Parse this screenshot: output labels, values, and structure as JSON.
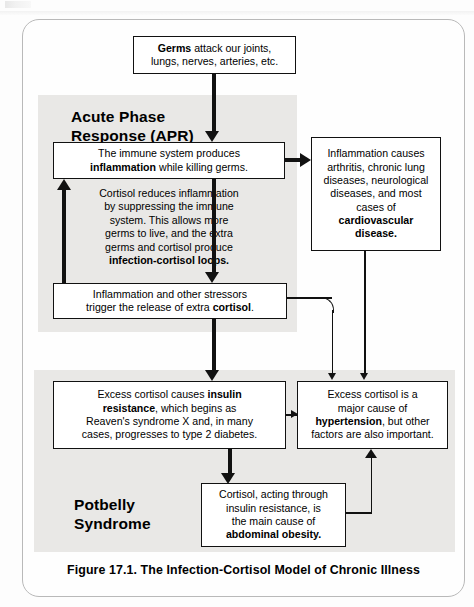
{
  "figure": {
    "caption": "Figure 17.1.  The Infection-Cortisol Model of Chronic Illness",
    "panels": {
      "apr_title": "Acute Phase\nResponse (APR)",
      "potbelly_title": "Potbelly\nSyndrome"
    },
    "nodes": {
      "germs": {
        "text_parts": [
          "Germs",
          " attack our joints, lungs, nerves, arteries, etc."
        ],
        "plain": "Germs attack our joints, lungs, nerves, arteries, etc."
      },
      "immune": {
        "plain": "The immune system produces inflammation while killing germs."
      },
      "inflammation_diseases": {
        "plain": "Inflammation causes arthritis, chronic lung diseases, neurological diseases, and most cases of cardiovascular disease."
      },
      "cortisol_reduces": {
        "plain": "Cortisol reduces inflammation by suppressing the immune system. This allows more germs to live, and the extra germs and cortisol produce infection-cortisol loops."
      },
      "trigger_cortisol": {
        "plain": "Inflammation and other stressors trigger the release of extra cortisol."
      },
      "insulin_resistance": {
        "plain": "Excess cortisol causes insulin resistance, which begins as Reaven's syndrome X and, in many cases, progresses to type 2 diabetes."
      },
      "hypertension": {
        "plain": "Excess cortisol is a major cause of hypertension, but other factors are also important."
      },
      "abdominal_obesity": {
        "plain": "Cortisol, acting through insulin resistance, is the main cause of abdominal obesity."
      }
    },
    "colors": {
      "panel_gray": "#e9e8e6",
      "line_black": "#111111",
      "frame_gray": "#b9b9b9",
      "page_white": "#fdfdfd"
    }
  }
}
